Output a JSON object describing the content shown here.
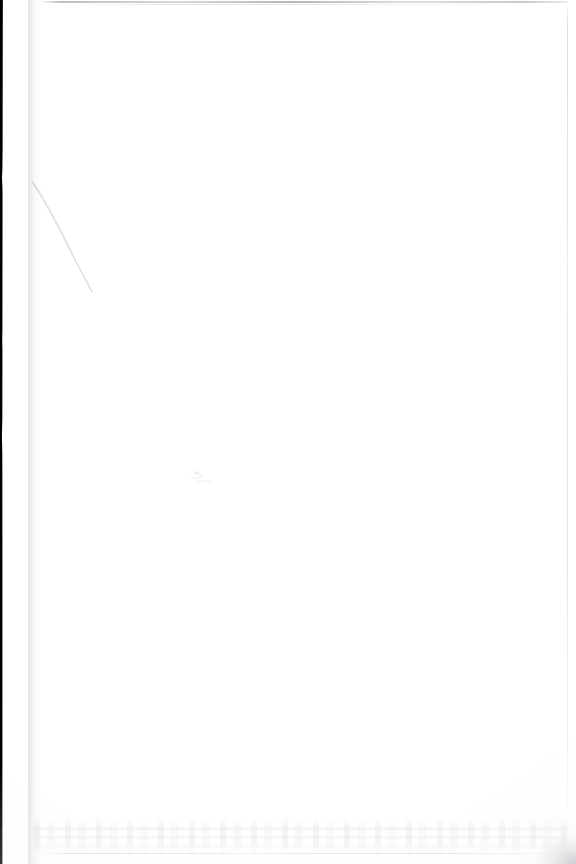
{
  "page": {
    "kind": "scanned-blank-page",
    "width": 576,
    "height": 864,
    "background_color": "#ffffff",
    "content_text": "",
    "has_readable_text": false,
    "note": ""
  },
  "artifacts": {
    "scanner_band": {
      "name": "scanner-bed-band",
      "color": "#000000",
      "edge": "left",
      "top_width_px": 38,
      "bottom_width_px": 31,
      "notch_y_px": 185
    },
    "crease": {
      "name": "paper-crease",
      "color": "#d8d8dc",
      "start_x_px": 32,
      "start_y_px": 182,
      "end_x_px": 92,
      "end_y_px": 292
    },
    "top_rule": {
      "name": "top-edge-rule",
      "color": "#8a8a90"
    },
    "right_rule": {
      "name": "right-edge-rule",
      "color": "#acacb2"
    },
    "bleed_band": {
      "name": "bottom-bleed-through",
      "color": "#e4e4e8",
      "top_y_px": 818,
      "height_px": 36
    },
    "corner_smudge": {
      "name": "bottom-right-smudge",
      "color": "#b0b0b6"
    }
  }
}
